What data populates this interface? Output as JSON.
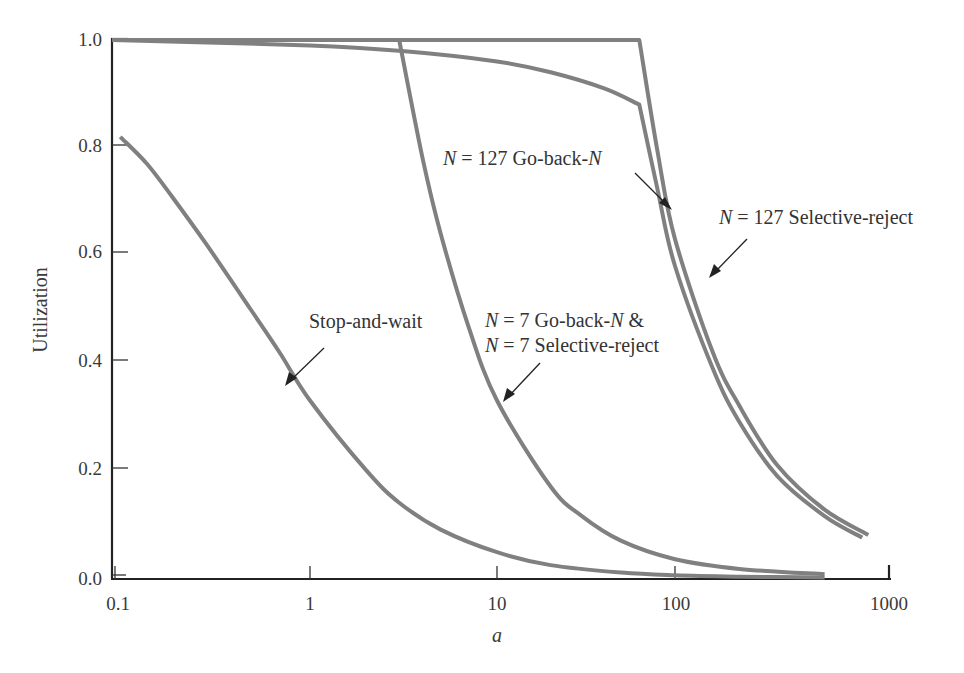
{
  "chart_data": {
    "type": "line",
    "title": "",
    "xlabel": "a",
    "ylabel": "Utilization",
    "xscale": "log",
    "xlim": [
      0.1,
      1000
    ],
    "ylim": [
      0.0,
      1.0
    ],
    "grid": false,
    "legend": "none (inline annotations)",
    "x_ticks": [
      "0.1",
      "1",
      "10",
      "100",
      "1000"
    ],
    "y_ticks": [
      "0.0",
      "0.2",
      "0.4",
      "0.6",
      "0.8",
      "1.0"
    ],
    "series": [
      {
        "name": "Stop-and-wait",
        "x": [
          0.11,
          0.15,
          0.2,
          0.3,
          0.5,
          0.7,
          1,
          2,
          3,
          5,
          10,
          20,
          50,
          100,
          200,
          500
        ],
        "y": [
          0.82,
          0.77,
          0.71,
          0.62,
          0.5,
          0.42,
          0.33,
          0.2,
          0.14,
          0.09,
          0.048,
          0.024,
          0.01,
          0.005,
          0.0025,
          0.001
        ]
      },
      {
        "name": "N = 7 Go-back-N & N = 7 Selective-reject",
        "x": [
          0.1,
          1,
          3,
          4,
          5,
          7,
          10,
          20,
          30,
          50,
          100,
          200,
          500
        ],
        "y": [
          1.0,
          1.0,
          1.0,
          0.78,
          0.64,
          0.47,
          0.33,
          0.17,
          0.115,
          0.069,
          0.035,
          0.017,
          0.007
        ]
      },
      {
        "name": "N = 127 Go-back-N",
        "x": [
          0.1,
          1,
          3,
          10,
          20,
          40,
          63,
          80,
          100,
          150,
          200,
          300,
          500,
          750
        ],
        "y": [
          1.0,
          0.99,
          0.98,
          0.96,
          0.94,
          0.91,
          0.88,
          0.72,
          0.58,
          0.39,
          0.29,
          0.19,
          0.115,
          0.075
        ]
      },
      {
        "name": "N = 127 Selective-reject",
        "x": [
          0.1,
          1,
          10,
          63,
          80,
          100,
          150,
          200,
          300,
          500,
          800
        ],
        "y": [
          1.0,
          1.0,
          1.0,
          1.0,
          0.79,
          0.63,
          0.42,
          0.32,
          0.21,
          0.127,
          0.08
        ]
      }
    ],
    "annotations": [
      {
        "text_parts": [
          "N",
          " = 127 Go-back-",
          "N"
        ],
        "target_series": "N = 127 Go-back-N"
      },
      {
        "text_parts": [
          "N",
          " = 127 Selective-reject"
        ],
        "target_series": "N = 127 Selective-reject"
      },
      {
        "text_parts": [
          "N",
          " = 7 Go-back-",
          "N",
          " &"
        ],
        "target_series": "N = 7 Go-back-N & N = 7 Selective-reject"
      },
      {
        "text_parts": [
          "N",
          " = 7 Selective-reject"
        ],
        "target_series": "N = 7 Go-back-N & N = 7 Selective-reject"
      },
      {
        "text_parts": [
          "Stop-and-wait"
        ],
        "target_series": "Stop-and-wait"
      }
    ]
  },
  "axes": {
    "x_title": "a",
    "y_title": "Utilization",
    "x_tick_labels": [
      "0.1",
      "1",
      "10",
      "100",
      "1000"
    ],
    "y_tick_labels": [
      "1.0",
      "0.8",
      "0.6",
      "0.4",
      "0.2",
      "0.0"
    ]
  },
  "labels": {
    "gbn127_n": "N",
    "gbn127_mid": " = 127 Go-back-",
    "gbn127_n2": "N",
    "sr127_n": "N",
    "sr127_rest": " = 127 Selective-reject",
    "n7_line1_n": "N",
    "n7_line1_mid": " = 7 Go-back-",
    "n7_line1_n2": "N",
    "n7_line1_end": " &",
    "n7_line2_n": "N",
    "n7_line2_rest": " = 7 Selective-reject",
    "saw": "Stop-and-wait"
  },
  "style": {
    "curve_color": "#808080",
    "axis_color": "#222222"
  }
}
